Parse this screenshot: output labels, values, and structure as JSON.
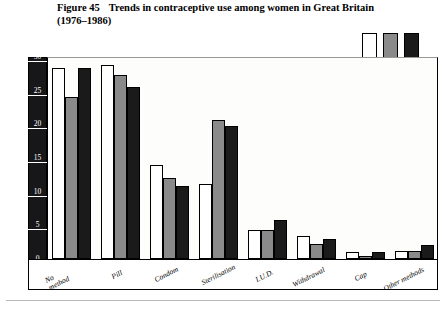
{
  "title": {
    "figure_number": "Figure 45",
    "text": "Trends in contraceptive use among women in Great Britain (1976–1986)"
  },
  "legend": {
    "entries": [
      {
        "label": "1976",
        "color": "#ffffff"
      },
      {
        "label": "1983",
        "color": "#8a8a8a"
      },
      {
        "label": "1986",
        "color": "#1a1a1a"
      }
    ]
  },
  "axis": {
    "y_title": "Percentage of women using method of contraception",
    "y_title_marker": "•",
    "y_unit_label": "%",
    "y_ticks": [
      "0",
      "5",
      "10",
      "15",
      "20",
      "25",
      "30"
    ]
  },
  "chart_data": {
    "type": "bar",
    "title": "Trends in contraceptive use among women in Great Britain (1976–1986)",
    "xlabel": "",
    "ylabel": "Percentage of women using method of contraception",
    "ylim": [
      0,
      30
    ],
    "yticks": [
      0,
      5,
      10,
      15,
      20,
      25,
      30
    ],
    "grid": false,
    "legend_position": "top-right",
    "categories": [
      "No\nmethod",
      "Pill",
      "Condom",
      "Sterilisation",
      "I.U.D.",
      "Withdrawal",
      "Cap",
      "Other methods"
    ],
    "series": [
      {
        "name": "1976",
        "color": "#ffffff",
        "values": [
          28.3,
          28.8,
          14.0,
          11.2,
          4.3,
          3.4,
          1.1,
          1.2
        ]
      },
      {
        "name": "1983",
        "color": "#8a8a8a",
        "values": [
          24.1,
          27.3,
          12.0,
          20.6,
          4.3,
          2.3,
          0.5,
          1.2
        ]
      },
      {
        "name": "1986",
        "color": "#1a1a1a",
        "values": [
          28.3,
          25.6,
          10.9,
          19.8,
          5.8,
          2.9,
          1.1,
          2.1
        ]
      }
    ]
  }
}
